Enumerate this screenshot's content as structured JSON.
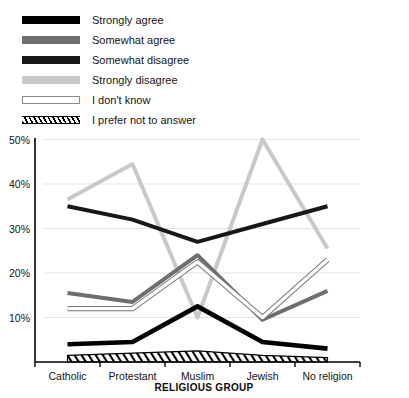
{
  "chart_data": {
    "type": "line",
    "title": "",
    "xlabel": "RELIGIOUS GROUP",
    "ylabel": "",
    "categories": [
      "Catholic",
      "Protestant",
      "Muslim",
      "Jewish",
      "No religion"
    ],
    "ytick_labels": [
      "10%",
      "20%",
      "30%",
      "40%",
      "50%"
    ],
    "ytick_values": [
      10,
      20,
      30,
      40,
      50
    ],
    "ylim": [
      0,
      50
    ],
    "grid": true,
    "legend_position": "top-left",
    "series": [
      {
        "name": "Strongly agree",
        "color": "#000000",
        "style": "solid-thick",
        "values": [
          4,
          4.5,
          12.5,
          4.5,
          3
        ]
      },
      {
        "name": "Somewhat agree",
        "color": "#6e6e6e",
        "style": "solid-medium",
        "values": [
          15.5,
          13.5,
          24,
          9.5,
          16
        ]
      },
      {
        "name": "Somewhat disagree",
        "color": "#171717",
        "style": "solid-medium",
        "values": [
          35,
          32,
          27,
          31,
          35
        ]
      },
      {
        "name": "Strongly disagree",
        "color": "#c9c9c9",
        "style": "solid-medium",
        "values": [
          36.5,
          44.5,
          10,
          50,
          25.5
        ]
      },
      {
        "name": "I don't know",
        "color": "#ffffff",
        "style": "outlined",
        "values": [
          12,
          12,
          22.5,
          10,
          23
        ]
      },
      {
        "name": "I prefer not to answer",
        "color": "#000000",
        "style": "hatched",
        "values": [
          1.5,
          2,
          2.5,
          1.5,
          1
        ]
      }
    ]
  },
  "legend": {
    "items": [
      {
        "label": "Strongly agree",
        "icon": "legend-swatch-solid-black"
      },
      {
        "label": "Somewhat agree",
        "icon": "legend-swatch-solid-gray"
      },
      {
        "label": "Somewhat disagree",
        "icon": "legend-swatch-solid-darkgray"
      },
      {
        "label": "Strongly disagree",
        "icon": "legend-swatch-solid-lightgray"
      },
      {
        "label": "I don't know",
        "icon": "legend-swatch-outline-white"
      },
      {
        "label": "I prefer not to answer",
        "icon": "legend-swatch-hatched"
      }
    ]
  }
}
